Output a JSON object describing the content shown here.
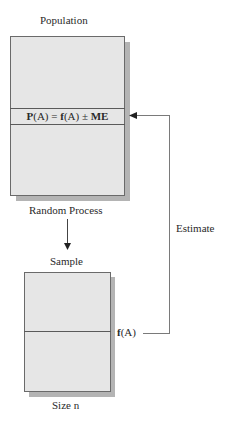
{
  "diagram": {
    "population": {
      "title": "Population",
      "formula": {
        "P": "P",
        "A1": "(A) = ",
        "f": "f",
        "A2": "(A) ± ",
        "ME": "ME"
      },
      "caption": "Random Process"
    },
    "sample": {
      "title": "Sample",
      "statistic": {
        "f": "f",
        "A": "(A)"
      },
      "caption": "Size n"
    },
    "feedback_label": "Estimate",
    "colors": {
      "box_fill": "#e6e6e6",
      "shadow": "#b4b4b4",
      "border": "#6a6a6a",
      "connector": "#7a7a7a"
    }
  }
}
